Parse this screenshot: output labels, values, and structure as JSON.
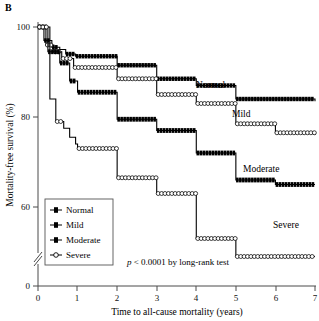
{
  "panel": {
    "letter": "B"
  },
  "axes": {
    "y_label": "Mortality-free survival (%)",
    "x_label": "Time to all-cause mortality (years)",
    "y_ticks": [
      "100",
      "80",
      "60",
      "0"
    ],
    "x_ticks": [
      "0",
      "1",
      "2",
      "3",
      "4",
      "5",
      "6",
      "7"
    ],
    "y_axis_break": true
  },
  "legend": {
    "items": [
      {
        "label": "Normal",
        "marker": "filled-cross"
      },
      {
        "label": "Mild",
        "marker": "filled-cross"
      },
      {
        "label": "Moderate",
        "marker": "filled-cross"
      },
      {
        "label": "Severe",
        "marker": "open-circle"
      }
    ]
  },
  "annotations": {
    "normal": "Normal",
    "mild": "Mild",
    "moderate": "Moderate",
    "severe": "Severe",
    "pvalue_italic": "p",
    "pvalue_rest": " < 0.0001 by long-rank test"
  },
  "colors": {
    "line": "#000000",
    "axis": "#4a4a4a",
    "background": "#ffffff",
    "open_marker_fill": "#ffffff"
  },
  "chart_data": {
    "type": "line",
    "chart_subtype": "kaplan-meier-step",
    "title": "",
    "xlabel": "Time to all-cause mortality (years)",
    "ylabel": "Mortality-free survival (%)",
    "xlim": [
      0,
      7
    ],
    "ylim": [
      55,
      100
    ],
    "y_axis_break_below": 55,
    "y_zero_shown": true,
    "grid": false,
    "legend_position": "lower-left-inside",
    "xticks": [
      0,
      1,
      2,
      3,
      4,
      5,
      6,
      7
    ],
    "yticks": [
      100,
      80,
      60,
      0
    ],
    "annotation": "p < 0.0001 by long-rank test",
    "series": [
      {
        "name": "Normal",
        "marker": "filled-cross",
        "line_style": "solid-thin",
        "x": [
          0.0,
          0.15,
          0.35,
          0.55,
          0.7,
          0.95,
          2.0,
          3.0,
          4.0,
          5.0,
          7.0
        ],
        "y": [
          100.0,
          97.0,
          95.5,
          95.0,
          94.0,
          93.5,
          91.5,
          88.5,
          87.0,
          84.0,
          83.5
        ]
      },
      {
        "name": "Mild",
        "marker": "open-square-chain",
        "line_style": "solid-thin",
        "x": [
          0.0,
          0.2,
          0.4,
          0.6,
          0.9,
          2.0,
          3.0,
          4.0,
          5.0,
          6.0,
          7.0
        ],
        "y": [
          100.0,
          96.0,
          94.5,
          93.0,
          91.0,
          88.5,
          85.0,
          83.0,
          78.5,
          76.5,
          76.0
        ]
      },
      {
        "name": "Moderate",
        "marker": "filled-cross",
        "line_style": "solid-thick",
        "x": [
          0.0,
          0.25,
          0.55,
          0.8,
          1.0,
          2.0,
          3.0,
          4.0,
          5.0,
          6.0,
          7.0
        ],
        "y": [
          100.0,
          94.5,
          92.0,
          88.0,
          85.5,
          79.5,
          77.0,
          72.0,
          66.0,
          65.0,
          65.0
        ]
      },
      {
        "name": "Severe",
        "marker": "open-circle-chain",
        "line_style": "solid-thin-open",
        "x": [
          0.0,
          0.3,
          0.45,
          0.65,
          0.8,
          0.95,
          1.0,
          2.0,
          3.0,
          4.0,
          5.0,
          7.0
        ],
        "y": [
          100.0,
          84.0,
          79.0,
          77.5,
          75.5,
          74.0,
          73.0,
          66.5,
          63.0,
          53.0,
          49.0,
          49.0
        ]
      }
    ]
  }
}
